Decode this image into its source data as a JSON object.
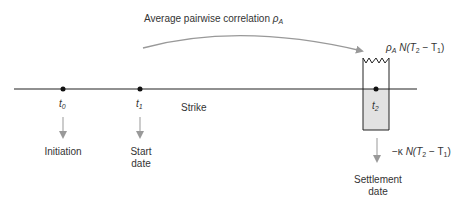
{
  "diagram": {
    "arc_label": "Average pairwise correlation",
    "arc_label_symbol": "ρ",
    "arc_label_sub": "A",
    "timeline": {
      "points": [
        {
          "id": "t0",
          "symbol": "t",
          "sub": "0",
          "caption_line1": "Initiation",
          "caption_line2": ""
        },
        {
          "id": "t1",
          "symbol": "t",
          "sub": "1",
          "caption_line1": "Start",
          "caption_line2": "date"
        },
        {
          "id": "t2",
          "symbol": "t",
          "sub": "2",
          "caption_line1": "Settlement",
          "caption_line2": "date"
        }
      ],
      "strike_label": "Strike"
    },
    "payoff_top": {
      "rho": "ρ",
      "rho_sub": "A",
      "N": "N(",
      "T": "T",
      "T_sub": "2",
      "minus": " − T",
      "T1_sub": "1",
      "close": ")"
    },
    "payoff_bottom": {
      "prefix": "−κ ",
      "N": "N(",
      "T": "T",
      "T_sub": "2",
      "minus": " − T",
      "T1_sub": "1",
      "close": ")"
    },
    "colors": {
      "line": "#222222",
      "arrow": "#999999",
      "box_fill": "#e2e2e2",
      "text": "#333333"
    }
  }
}
